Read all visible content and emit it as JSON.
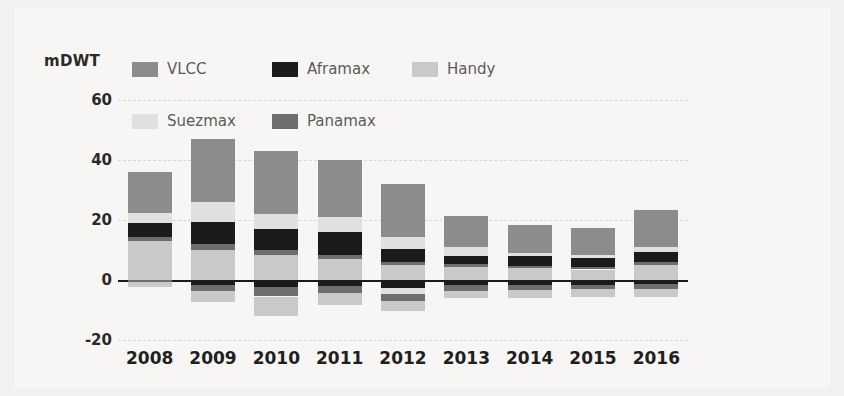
{
  "axis": {
    "unit_label": "mDWT",
    "y_ticks": [
      "60",
      "40",
      "20",
      "0",
      "-20"
    ],
    "y_values": [
      60,
      40,
      20,
      0,
      -20
    ]
  },
  "legend": {
    "rows": [
      [
        {
          "label": "VLCC",
          "color": "#8c8c8c",
          "key": "vlcc"
        },
        {
          "label": "Aframax",
          "color": "#1b1b1b",
          "key": "aframax"
        },
        {
          "label": "Handy",
          "color": "#c9c9c9",
          "key": "handy"
        }
      ],
      [
        {
          "label": "Suezmax",
          "color": "#e0e0e0",
          "key": "suezmax"
        },
        {
          "label": "Panamax",
          "color": "#6e6e6e",
          "key": "panamax"
        }
      ]
    ]
  },
  "chart_data": {
    "type": "bar",
    "stacked": true,
    "title": "",
    "xlabel": "",
    "ylabel": "mDWT",
    "ylim": [
      -20,
      60
    ],
    "grid": true,
    "legend_position": "top",
    "categories": [
      "2008",
      "2009",
      "2010",
      "2011",
      "2012",
      "2013",
      "2014",
      "2015",
      "2016"
    ],
    "series": [
      {
        "name": "VLCC",
        "color": "#8c8c8c",
        "values": [
          8.5,
          15.5,
          17.5,
          15.0,
          14.0,
          8.5,
          8.0,
          8.5,
          11.5
        ]
      },
      {
        "name": "Aframax",
        "color": "#1b1b1b",
        "values": [
          4.5,
          6.5,
          5.5,
          6.5,
          3.5,
          2.0,
          3.5,
          3.0,
          3.0
        ]
      },
      {
        "name": "Handy",
        "color": "#c9c9c9",
        "values": [
          13.0,
          10.5,
          8.0,
          8.0,
          6.5,
          4.5,
          3.5,
          3.0,
          4.5
        ]
      },
      {
        "name": "Suezmax",
        "color": "#e0e0e0",
        "values": [
          4.5,
          8.5,
          6.5,
          6.5,
          4.5,
          4.0,
          2.0,
          2.0,
          2.5
        ]
      },
      {
        "name": "Panamax",
        "color": "#6e6e6e",
        "values": [
          5.5,
          6.0,
          5.5,
          4.0,
          3.5,
          2.5,
          1.5,
          1.0,
          2.0
        ]
      }
    ],
    "totals_positive": [
      36.0,
      47.0,
      43.0,
      40.0,
      32.0,
      21.5,
      18.5,
      17.5,
      23.5
    ],
    "totals_negative": [
      -2.5,
      -7.5,
      -12.0,
      -8.5,
      -10.5,
      -6.0,
      -6.0,
      -5.5,
      -5.5
    ],
    "demolition": [
      {
        "year": "2008",
        "segments": [
          {
            "name": "Panamax",
            "color": "#6e6e6e",
            "value": -0.8
          },
          {
            "name": "Handy",
            "color": "#c9c9c9",
            "value": -1.7
          }
        ]
      },
      {
        "year": "2009",
        "segments": [
          {
            "name": "Aframax",
            "color": "#1b1b1b",
            "value": -1.6
          },
          {
            "name": "Panamax",
            "color": "#6e6e6e",
            "value": -2.2
          },
          {
            "name": "Handy",
            "color": "#c9c9c9",
            "value": -3.7
          }
        ]
      },
      {
        "year": "2010",
        "segments": [
          {
            "name": "Aframax",
            "color": "#1b1b1b",
            "value": -2.4
          },
          {
            "name": "Panamax",
            "color": "#6e6e6e",
            "value": -3.1
          },
          {
            "name": "Handy",
            "color": "#c9c9c9",
            "value": -6.5
          }
        ]
      },
      {
        "year": "2011",
        "segments": [
          {
            "name": "Aframax",
            "color": "#1b1b1b",
            "value": -2.0
          },
          {
            "name": "Panamax",
            "color": "#6e6e6e",
            "value": -2.3
          },
          {
            "name": "Handy",
            "color": "#c9c9c9",
            "value": -4.2
          }
        ]
      },
      {
        "year": "2012",
        "segments": [
          {
            "name": "Aframax",
            "color": "#1b1b1b",
            "value": -2.6
          },
          {
            "name": "Suezmax",
            "color": "#e0e0e0",
            "value": -2.2
          },
          {
            "name": "Panamax",
            "color": "#6e6e6e",
            "value": -2.3
          },
          {
            "name": "Handy",
            "color": "#c9c9c9",
            "value": -3.4
          }
        ]
      },
      {
        "year": "2013",
        "segments": [
          {
            "name": "Aframax",
            "color": "#1b1b1b",
            "value": -1.8
          },
          {
            "name": "Panamax",
            "color": "#6e6e6e",
            "value": -1.8
          },
          {
            "name": "Handy",
            "color": "#c9c9c9",
            "value": -2.4
          }
        ]
      },
      {
        "year": "2014",
        "segments": [
          {
            "name": "Aframax",
            "color": "#1b1b1b",
            "value": -1.8
          },
          {
            "name": "Panamax",
            "color": "#6e6e6e",
            "value": -1.6
          },
          {
            "name": "Handy",
            "color": "#c9c9c9",
            "value": -2.6
          }
        ]
      },
      {
        "year": "2015",
        "segments": [
          {
            "name": "Aframax",
            "color": "#1b1b1b",
            "value": -1.5
          },
          {
            "name": "Panamax",
            "color": "#6e6e6e",
            "value": -1.5
          },
          {
            "name": "Handy",
            "color": "#c9c9c9",
            "value": -2.5
          }
        ]
      },
      {
        "year": "2016",
        "segments": [
          {
            "name": "Aframax",
            "color": "#1b1b1b",
            "value": -1.4
          },
          {
            "name": "Panamax",
            "color": "#6e6e6e",
            "value": -1.6
          },
          {
            "name": "Handy",
            "color": "#c9c9c9",
            "value": -2.5
          }
        ]
      }
    ],
    "deliveries": [
      {
        "year": "2008",
        "segments": [
          {
            "name": "Handy",
            "color": "#c9c9c9",
            "value": 13.0
          },
          {
            "name": "Panamax",
            "color": "#6e6e6e",
            "value": 1.5
          },
          {
            "name": "Aframax",
            "color": "#1b1b1b",
            "value": 4.5
          },
          {
            "name": "Suezmax",
            "color": "#e0e0e0",
            "value": 3.5
          },
          {
            "name": "VLCC",
            "color": "#8c8c8c",
            "value": 13.5
          }
        ]
      },
      {
        "year": "2009",
        "segments": [
          {
            "name": "Handy",
            "color": "#c9c9c9",
            "value": 10.0
          },
          {
            "name": "Panamax",
            "color": "#6e6e6e",
            "value": 2.0
          },
          {
            "name": "Aframax",
            "color": "#1b1b1b",
            "value": 7.5
          },
          {
            "name": "Suezmax",
            "color": "#e0e0e0",
            "value": 6.5
          },
          {
            "name": "VLCC",
            "color": "#8c8c8c",
            "value": 21.0
          }
        ]
      },
      {
        "year": "2010",
        "segments": [
          {
            "name": "Handy",
            "color": "#c9c9c9",
            "value": 8.5
          },
          {
            "name": "Panamax",
            "color": "#6e6e6e",
            "value": 1.5
          },
          {
            "name": "Aframax",
            "color": "#1b1b1b",
            "value": 7.0
          },
          {
            "name": "Suezmax",
            "color": "#e0e0e0",
            "value": 5.0
          },
          {
            "name": "VLCC",
            "color": "#8c8c8c",
            "value": 21.0
          }
        ]
      },
      {
        "year": "2011",
        "segments": [
          {
            "name": "Handy",
            "color": "#c9c9c9",
            "value": 7.0
          },
          {
            "name": "Panamax",
            "color": "#6e6e6e",
            "value": 1.5
          },
          {
            "name": "Aframax",
            "color": "#1b1b1b",
            "value": 7.5
          },
          {
            "name": "Suezmax",
            "color": "#e0e0e0",
            "value": 5.0
          },
          {
            "name": "VLCC",
            "color": "#8c8c8c",
            "value": 19.0
          }
        ]
      },
      {
        "year": "2012",
        "segments": [
          {
            "name": "Handy",
            "color": "#c9c9c9",
            "value": 5.0
          },
          {
            "name": "Panamax",
            "color": "#6e6e6e",
            "value": 1.0
          },
          {
            "name": "Aframax",
            "color": "#1b1b1b",
            "value": 4.5
          },
          {
            "name": "Suezmax",
            "color": "#e0e0e0",
            "value": 4.0
          },
          {
            "name": "VLCC",
            "color": "#8c8c8c",
            "value": 17.5
          }
        ]
      },
      {
        "year": "2013",
        "segments": [
          {
            "name": "Handy",
            "color": "#c9c9c9",
            "value": 4.5
          },
          {
            "name": "Panamax",
            "color": "#6e6e6e",
            "value": 1.0
          },
          {
            "name": "Aframax",
            "color": "#1b1b1b",
            "value": 2.5
          },
          {
            "name": "Suezmax",
            "color": "#e0e0e0",
            "value": 3.0
          },
          {
            "name": "VLCC",
            "color": "#8c8c8c",
            "value": 10.5
          }
        ]
      },
      {
        "year": "2014",
        "segments": [
          {
            "name": "Handy",
            "color": "#c9c9c9",
            "value": 4.0
          },
          {
            "name": "Panamax",
            "color": "#6e6e6e",
            "value": 0.8
          },
          {
            "name": "Aframax",
            "color": "#1b1b1b",
            "value": 3.2
          },
          {
            "name": "Suezmax",
            "color": "#e0e0e0",
            "value": 1.0
          },
          {
            "name": "VLCC",
            "color": "#8c8c8c",
            "value": 9.5
          }
        ]
      },
      {
        "year": "2015",
        "segments": [
          {
            "name": "Handy",
            "color": "#c9c9c9",
            "value": 3.5
          },
          {
            "name": "Panamax",
            "color": "#6e6e6e",
            "value": 0.8
          },
          {
            "name": "Aframax",
            "color": "#1b1b1b",
            "value": 3.0
          },
          {
            "name": "Suezmax",
            "color": "#e0e0e0",
            "value": 1.2
          },
          {
            "name": "VLCC",
            "color": "#8c8c8c",
            "value": 9.0
          }
        ]
      },
      {
        "year": "2016",
        "segments": [
          {
            "name": "Handy",
            "color": "#c9c9c9",
            "value": 5.0
          },
          {
            "name": "Panamax",
            "color": "#6e6e6e",
            "value": 1.0
          },
          {
            "name": "Aframax",
            "color": "#1b1b1b",
            "value": 3.5
          },
          {
            "name": "Suezmax",
            "color": "#e0e0e0",
            "value": 1.5
          },
          {
            "name": "VLCC",
            "color": "#8c8c8c",
            "value": 12.5
          }
        ]
      }
    ]
  }
}
